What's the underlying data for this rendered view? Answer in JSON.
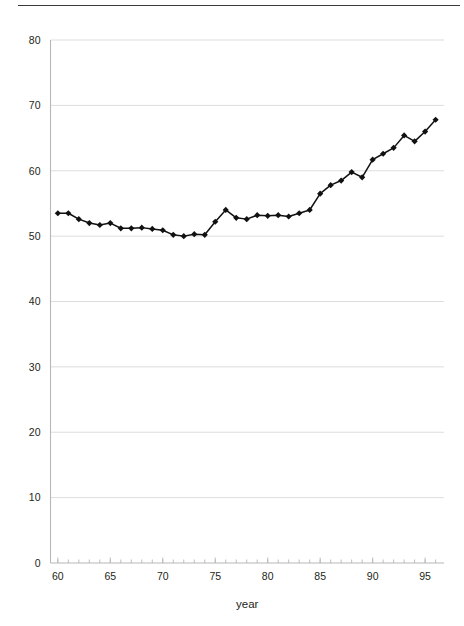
{
  "chart_data": {
    "type": "line",
    "title": "",
    "xlabel": "year",
    "ylabel": "",
    "xlim": [
      59.3,
      96.8
    ],
    "ylim": [
      0,
      80
    ],
    "grid": true,
    "legend": false,
    "legend_position": "none",
    "x_ticks_major": [
      60,
      65,
      70,
      75,
      80,
      85,
      90,
      95
    ],
    "x_tick_labels": [
      "60",
      "65",
      "70",
      "75",
      "80",
      "85",
      "90",
      "95"
    ],
    "x_minor_tick_step": 1,
    "y_ticks": [
      0,
      10,
      20,
      30,
      40,
      50,
      60,
      70,
      80
    ],
    "y_tick_labels": [
      "0",
      "10",
      "20",
      "30",
      "40",
      "50",
      "60",
      "70",
      "80"
    ],
    "marker": "diamond",
    "marker_color": "#111111",
    "line_color": "#111111",
    "x": [
      60,
      61,
      62,
      63,
      64,
      65,
      66,
      67,
      68,
      69,
      70,
      71,
      72,
      73,
      74,
      75,
      76,
      77,
      78,
      79,
      80,
      81,
      82,
      83,
      84,
      85,
      86,
      87,
      88,
      89,
      90,
      91,
      92,
      93,
      94,
      95,
      96
    ],
    "values": [
      53.5,
      53.5,
      52.6,
      52.0,
      51.7,
      52.0,
      51.2,
      51.2,
      51.3,
      51.1,
      50.9,
      50.2,
      50.0,
      50.3,
      50.2,
      52.2,
      54.0,
      52.8,
      52.6,
      53.2,
      53.1,
      53.2,
      53.0,
      53.5,
      54.0,
      56.5,
      57.8,
      58.5,
      59.8,
      59.0,
      61.7,
      62.6,
      63.5,
      65.4,
      64.5,
      66.0,
      67.8
    ],
    "series": [
      {
        "name": "series-1",
        "values": [
          53.5,
          53.5,
          52.6,
          52.0,
          51.7,
          52.0,
          51.2,
          51.2,
          51.3,
          51.1,
          50.9,
          50.2,
          50.0,
          50.3,
          50.2,
          52.2,
          54.0,
          52.8,
          52.6,
          53.2,
          53.1,
          53.2,
          53.0,
          53.5,
          54.0,
          56.5,
          57.8,
          58.5,
          59.8,
          59.0,
          61.7,
          62.6,
          63.5,
          65.4,
          64.5,
          66.0,
          67.8
        ]
      }
    ]
  },
  "figure": {
    "axis_label_x": "year"
  }
}
